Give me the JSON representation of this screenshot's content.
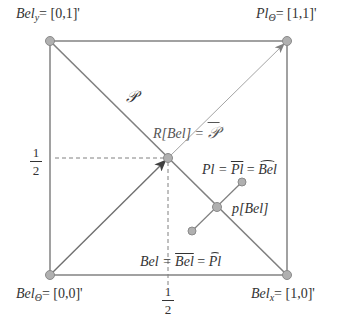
{
  "diagram": {
    "type": "geometric-simplex",
    "colors": {
      "line": "#808080",
      "vertex_fill": "#b0b0b0",
      "vertex_stroke": "#8a8a8a",
      "text": "#333333",
      "arrow": "#404040"
    },
    "vertices": {
      "bel_y": {
        "name": "Bel",
        "sub": "y",
        "coord": "= [0,1]'"
      },
      "pl_theta": {
        "name": "Pl",
        "sub": "Θ",
        "coord": "= [1,1]'"
      },
      "bel_theta": {
        "name": "Bel",
        "sub": "Θ",
        "coord": "= [0,0]'"
      },
      "bel_x": {
        "name": "Bel",
        "sub": "x",
        "coord": "= [1,0]'"
      }
    },
    "labels": {
      "prob_simplex": "𝒫",
      "relative_belief": "R[Bel] = 𝒫̄",
      "r_bel_prefix": "R[Bel] = ",
      "p_bar": "𝒫",
      "pl_eq": "Pl = ",
      "pl_bar": "Pl",
      "bel_hat": "Bel",
      "pl_eq_mid": " = ",
      "p_bel": "p[Bel]",
      "bel_eq": "Bel = ",
      "bel_bar": "Bel",
      "pl_hat": "Pl",
      "half_num": "1",
      "half_den": "2"
    }
  }
}
